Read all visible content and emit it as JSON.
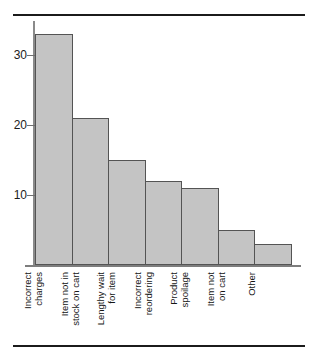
{
  "chart_data": {
    "type": "bar",
    "title": "",
    "subtitle": "",
    "xlabel": "",
    "ylabel": "",
    "categories": [
      "Incorrect charges",
      "Item not in stock on cart",
      "Lengthy wait for item",
      "Incorrect reordering",
      "Product spoilage",
      "Item not on cart",
      "Other"
    ],
    "category_lines": [
      [
        "Incorrect",
        "charges"
      ],
      [
        "Item not in",
        "stock on cart"
      ],
      [
        "Lengthy wait",
        "for item"
      ],
      [
        "Incorrect",
        "reordering"
      ],
      [
        "Product",
        "spoilage"
      ],
      [
        "Item not",
        "on cart"
      ],
      [
        "Other"
      ]
    ],
    "values": [
      33,
      21,
      15,
      12,
      11,
      5,
      3
    ],
    "ylim": [
      0,
      35
    ],
    "yticks": [
      10,
      20,
      30
    ],
    "ytick_labels": [
      "10",
      "20",
      "30"
    ],
    "grid": false,
    "legend": false,
    "legend_position": "none",
    "bar_fill_color": "#c4c4c4",
    "bar_edge_color": "#545454",
    "axis_color": "#7d7d7d",
    "rule_color": "#1b1b1b",
    "label_rotation": 90
  }
}
